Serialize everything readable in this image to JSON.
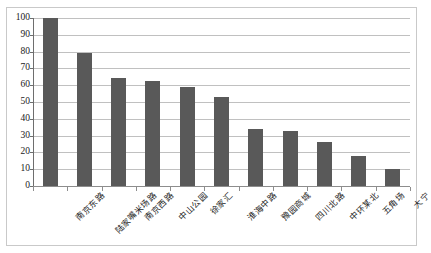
{
  "chart_data": {
    "type": "bar",
    "title": "",
    "subtitle": "",
    "xlabel": "",
    "ylabel": "",
    "ylim": [
      0,
      100
    ],
    "ytick_step": 10,
    "yticks": [
      "0",
      "10",
      "20",
      "30",
      "40",
      "50",
      "60",
      "70",
      "80",
      "90",
      "100"
    ],
    "grid": true,
    "legend": false,
    "legend_position": "none",
    "bar_color": "#595959",
    "gridline_color": "#c0c0c0",
    "axis_color": "#8d8d8d",
    "plot_background": "#ffffff",
    "frame_border_color": "#c9c9c9",
    "categories": [
      "南京东路",
      "陆家嘴米场路",
      "南京西路",
      "中山公园",
      "徐家汇",
      "淮海中路",
      "豫园商城",
      "四川北路",
      "中环某北",
      "五角场",
      "大宁"
    ],
    "values": [
      100,
      79,
      64,
      62.5,
      59,
      53,
      34,
      32.5,
      26,
      18,
      10
    ],
    "series": [
      {
        "name": "",
        "values": [
          100,
          79,
          64,
          62.5,
          59,
          53,
          34,
          32.5,
          26,
          18,
          10
        ]
      }
    ]
  }
}
